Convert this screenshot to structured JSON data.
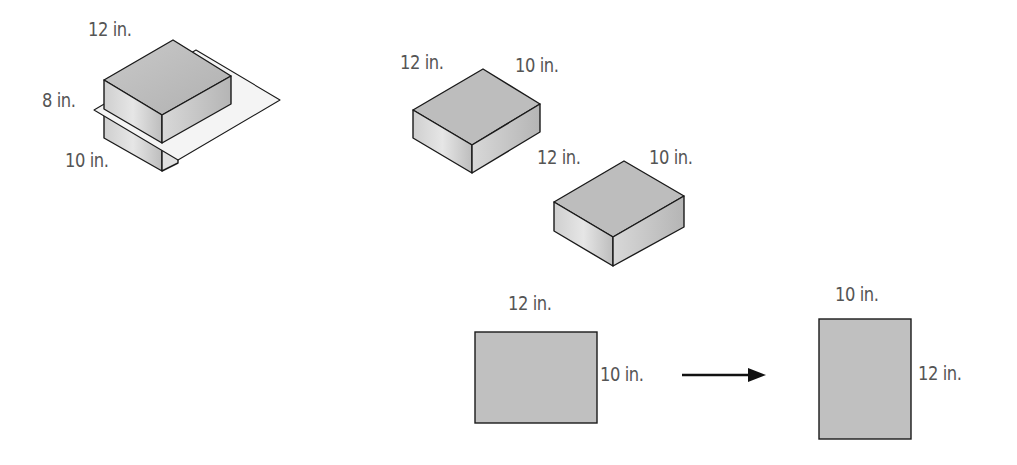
{
  "figure_1_box_cut": {
    "labels": {
      "length": "12 in.",
      "height": "8 in.",
      "width": "10 in."
    }
  },
  "figure_2_box_a": {
    "labels": {
      "length": "12 in.",
      "width": "10 in."
    }
  },
  "figure_3_box_b": {
    "labels": {
      "length": "12 in.",
      "width": "10 in."
    }
  },
  "figure_4_rect_before": {
    "labels": {
      "top": "12 in.",
      "side": "10 in."
    }
  },
  "figure_5_rect_after": {
    "labels": {
      "top": "10 in.",
      "side": "12 in."
    }
  },
  "arrow": {
    "direction": "right",
    "icon": "arrow-right-icon"
  },
  "colors": {
    "outline": "#1a1a1a",
    "face_top": "#b8b8b8",
    "face_left": "#d2d2d2",
    "face_right": "#c4c4c4",
    "plane": "#f2f2f2",
    "rect_fill": "#c0c0c0",
    "label_text": "#555555"
  }
}
